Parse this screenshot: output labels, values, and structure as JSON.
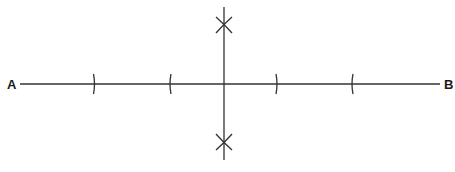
{
  "diagram": {
    "type": "perpendicular-bisector-construction",
    "points": {
      "A": {
        "label": "A",
        "x": 20,
        "y": 84
      },
      "B": {
        "label": "B",
        "x": 440,
        "y": 84
      }
    },
    "segment_AB": {
      "x1": 20,
      "y1": 84,
      "x2": 440,
      "y2": 84
    },
    "bisector": {
      "x1": 224,
      "y1": 7,
      "x2": 224,
      "y2": 160
    },
    "arc_ticks_on_AB": [
      94,
      171,
      276,
      353
    ],
    "intersection_marks": [
      {
        "x": 224,
        "y": 25
      },
      {
        "x": 224,
        "y": 142
      }
    ],
    "stroke_color": "#333333",
    "label_color": "#1a1a1a"
  }
}
